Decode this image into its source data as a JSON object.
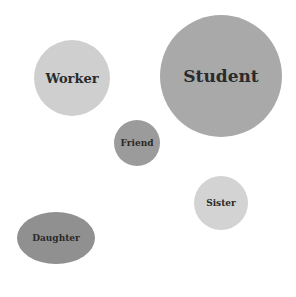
{
  "diagram": {
    "type": "bubble-diagram",
    "nodes": [
      {
        "id": "worker",
        "label": "Worker",
        "cx": 72,
        "cy": 78,
        "rx": 38,
        "ry": 38,
        "color": "#cfcfcf",
        "font_size": 13
      },
      {
        "id": "student",
        "label": "Student",
        "cx": 221,
        "cy": 76,
        "rx": 61,
        "ry": 61,
        "color": "#a9a9a9",
        "font_size": 17
      },
      {
        "id": "friend",
        "label": "Friend",
        "cx": 137,
        "cy": 143,
        "rx": 23,
        "ry": 23,
        "color": "#9b9b9b",
        "font_size": 9
      },
      {
        "id": "sister",
        "label": "Sister",
        "cx": 221,
        "cy": 203,
        "rx": 27,
        "ry": 27,
        "color": "#d3d3d3",
        "font_size": 9
      },
      {
        "id": "daughter",
        "label": "Daughter",
        "cx": 56,
        "cy": 238,
        "rx": 39,
        "ry": 26,
        "color": "#909090",
        "font_size": 9
      }
    ]
  }
}
